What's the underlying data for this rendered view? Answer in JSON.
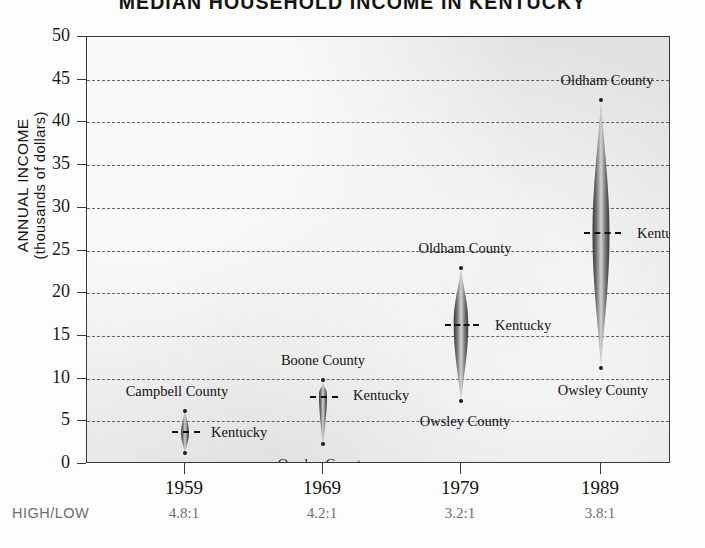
{
  "chart_data": {
    "type": "scatter",
    "title": "MEDIAN HOUSEHOLD INCOME IN KENTUCKY",
    "xlabel": "",
    "ylabel": "ANNUAL INCOME",
    "ylabel_sub": "(thousands of dollars)",
    "ylim": [
      0,
      50
    ],
    "ytick_labels": [
      "50",
      "45",
      "40",
      "35",
      "30",
      "25",
      "20",
      "15",
      "10",
      "5",
      "0"
    ],
    "ytick_values": [
      50,
      45,
      40,
      35,
      30,
      25,
      20,
      15,
      10,
      5,
      0
    ],
    "grid": true,
    "grid_style": "dashed-horizontal",
    "legend": "none",
    "categories": [
      "1959",
      "1969",
      "1979",
      "1989"
    ],
    "high_low_row_label": "HIGH/LOW",
    "high_low_ratios": [
      "4.8:1",
      "4.2:1",
      "3.2:1",
      "3.8:1"
    ],
    "series": [
      {
        "name": "High county",
        "values": [
          6.2,
          9.8,
          23.0,
          42.6
        ],
        "labels": [
          "Campbell County",
          "Boone County",
          "Oldham County",
          "Oldham County"
        ]
      },
      {
        "name": "Kentucky median",
        "values": [
          3.7,
          7.8,
          16.3,
          27.0
        ],
        "labels": [
          "Kentucky",
          "Kentucky",
          "Kentucky",
          "Kentucky"
        ]
      },
      {
        "name": "Low county",
        "values": [
          1.3,
          2.3,
          7.4,
          11.2
        ],
        "labels": [
          "Owsley County",
          "Owsley County",
          "Owsley County",
          "Owsley County"
        ]
      }
    ],
    "points": [
      {
        "year": "1959",
        "high_label": "Campbell County",
        "high_value": 6.2,
        "median_label": "Kentucky",
        "median_value": 3.7,
        "low_label": "Owsley County",
        "low_value": 1.3,
        "ratio": "4.8:1"
      },
      {
        "year": "1969",
        "high_label": "Boone County",
        "high_value": 9.8,
        "median_label": "Kentucky",
        "median_value": 7.8,
        "low_label": "Owsley County",
        "low_value": 2.3,
        "ratio": "4.2:1"
      },
      {
        "year": "1979",
        "high_label": "Oldham County",
        "high_value": 23.0,
        "median_label": "Kentucky",
        "median_value": 16.3,
        "low_label": "Owsley County",
        "low_value": 7.4,
        "ratio": "3.2:1"
      },
      {
        "year": "1989",
        "high_label": "Oldham County",
        "high_value": 42.6,
        "median_label": "Kentucky",
        "median_value": 27.0,
        "low_label": "Owsley County",
        "low_value": 11.2,
        "ratio": "3.8:1"
      }
    ]
  },
  "colors": {
    "plot_background": "#e9e9e9",
    "axis": "#3a3a3a",
    "grid": "#4a4a4a",
    "text": "#15120f",
    "muted_text": "#6d6d6d",
    "marker_dark": "#4d4d4d",
    "marker_light": "#c9c9c9"
  }
}
